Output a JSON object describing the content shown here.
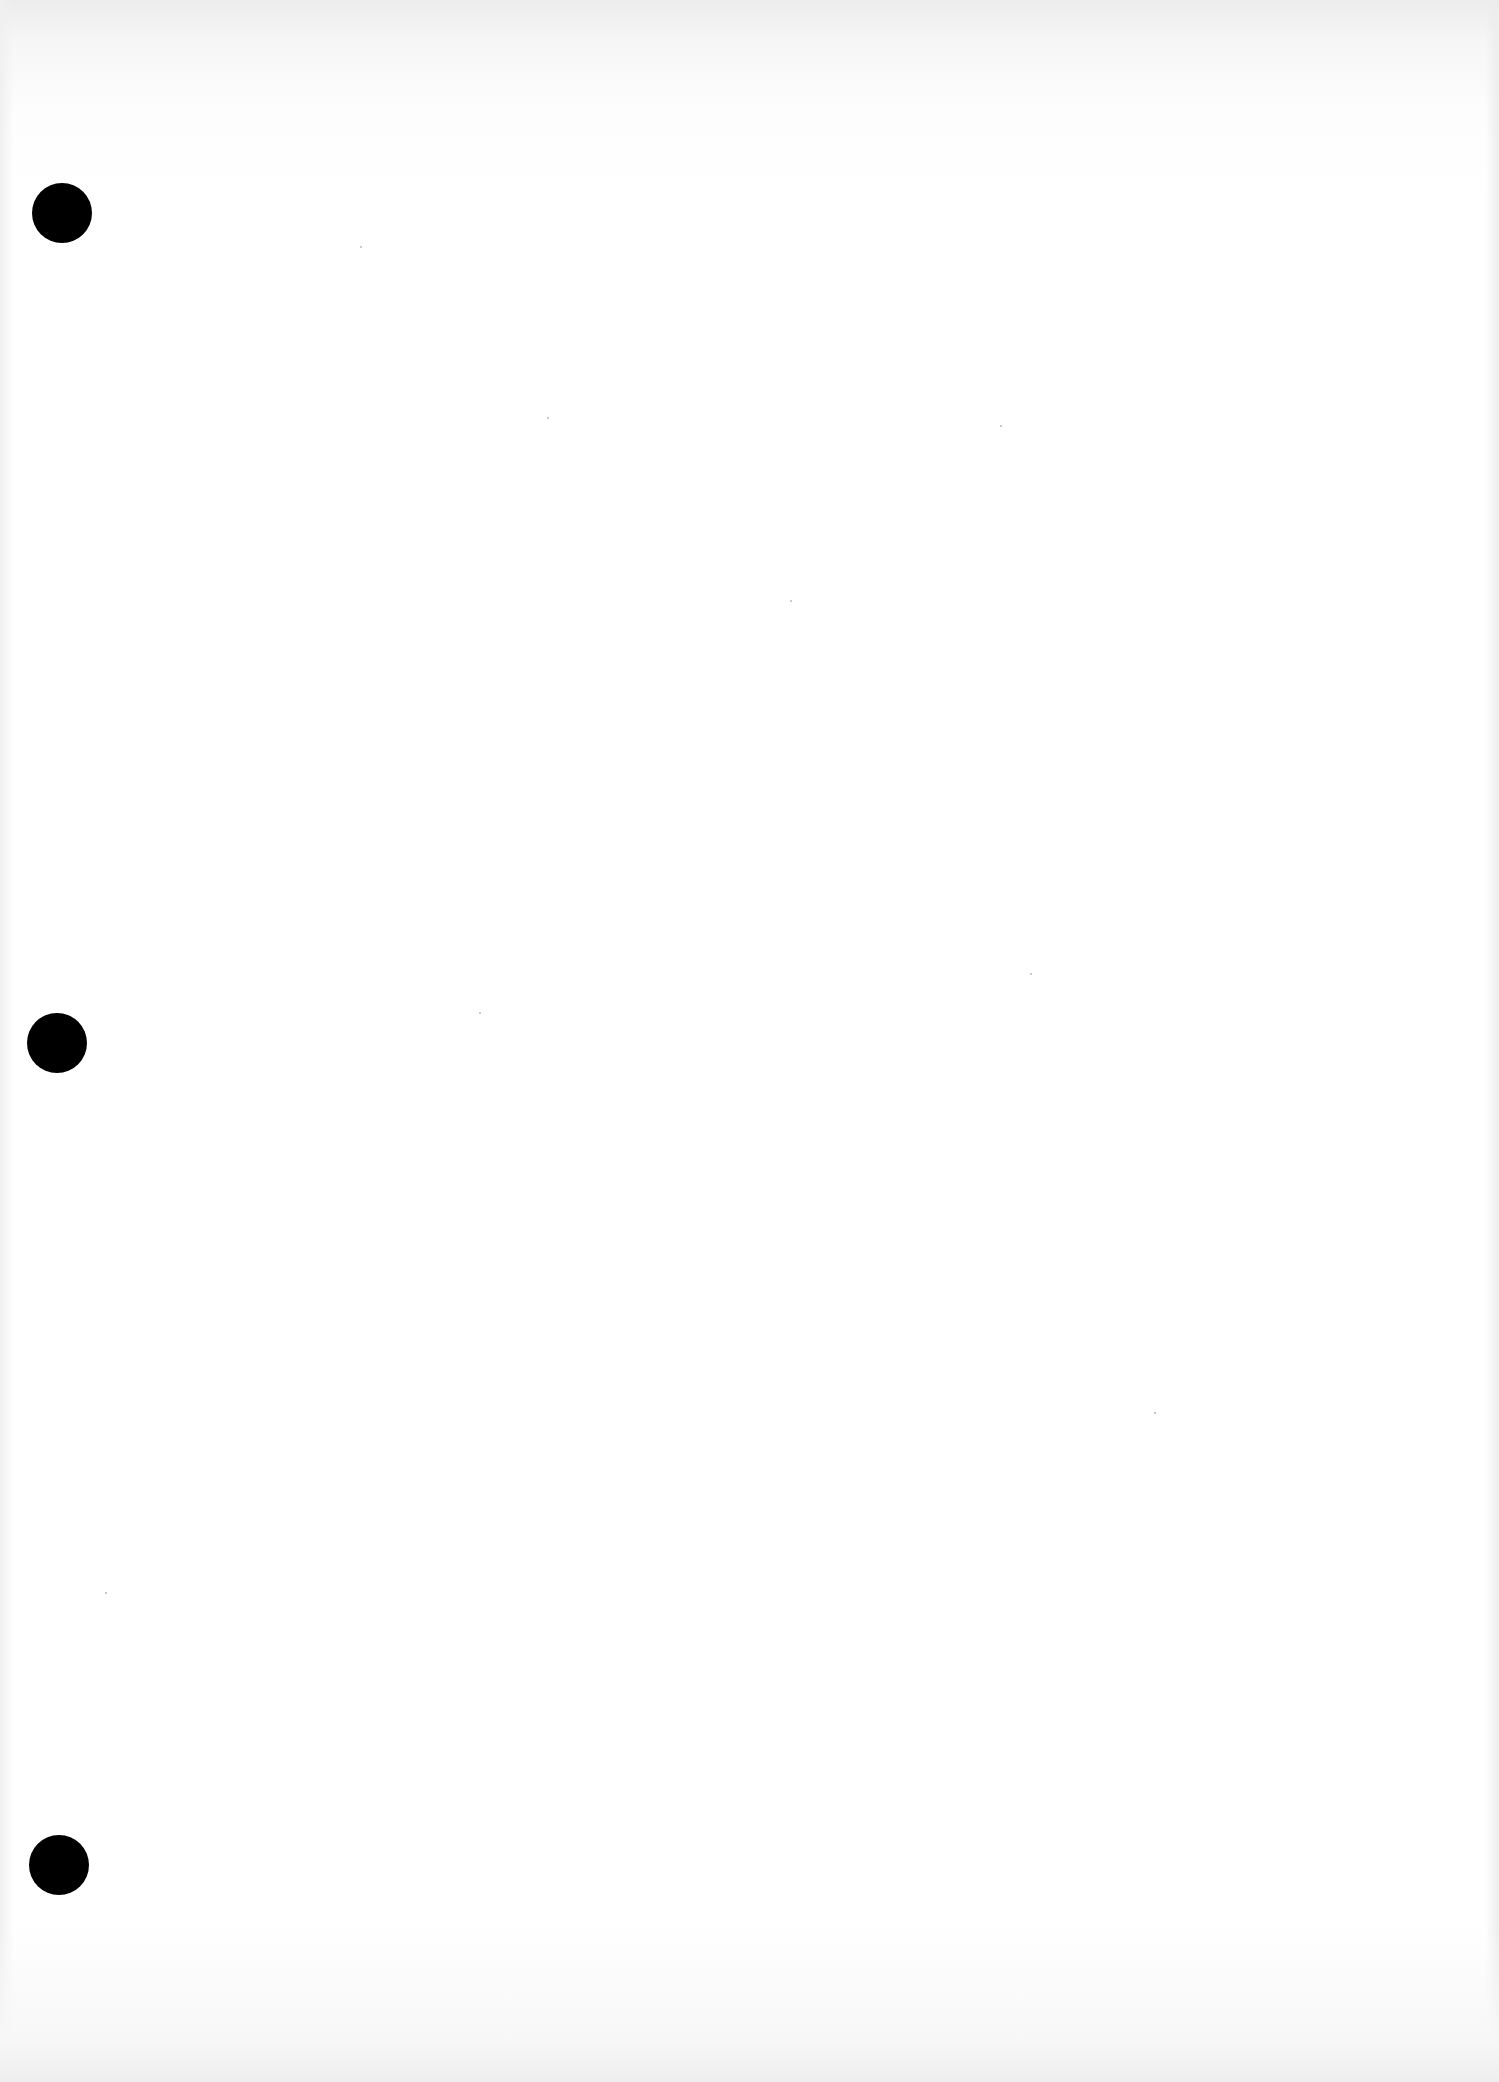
{
  "page": {
    "type": "blank scanned sheet",
    "background_color": "#ffffff",
    "text": "",
    "punch_holes": [
      {
        "cx": 62,
        "cy": 213,
        "diameter": 60,
        "color": "#000000"
      },
      {
        "cx": 57,
        "cy": 1043,
        "diameter": 60,
        "color": "#000000"
      },
      {
        "cx": 59,
        "cy": 1865,
        "diameter": 60,
        "color": "#000000"
      }
    ]
  }
}
